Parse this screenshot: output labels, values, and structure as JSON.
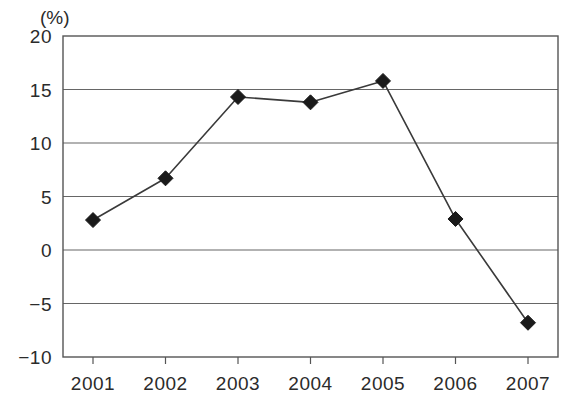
{
  "chart_data": {
    "type": "line",
    "title": "",
    "subtitle": "",
    "xlabel": "",
    "ylabel": "",
    "unit_label": "(%)",
    "categories": [
      "2001",
      "2002",
      "2003",
      "2004",
      "2005",
      "2006",
      "2007"
    ],
    "values": [
      2.8,
      6.7,
      14.3,
      13.8,
      15.8,
      2.9,
      -6.8
    ],
    "series": [
      {
        "name": "",
        "values": [
          2.8,
          6.7,
          14.3,
          13.8,
          15.8,
          2.9,
          -6.8
        ]
      }
    ],
    "ylim": [
      -10,
      20
    ],
    "yticks": [
      20,
      15,
      10,
      5,
      0,
      -5,
      -10
    ],
    "ytick_labels": [
      "20",
      "15",
      "10",
      "5",
      "0",
      "−5",
      "−10"
    ],
    "xtick_labels": [
      "2001",
      "2002",
      "2003",
      "2004",
      "2005",
      "2006",
      "2007"
    ],
    "grid": true,
    "grid_axis": "y",
    "legend": false,
    "legend_position": "none",
    "marker": "diamond",
    "marker_color": "#1a1a1a",
    "line_color": "#3a3a3a",
    "axis_color": "#555555",
    "grid_color": "#666666",
    "background_color": "#ffffff",
    "text_color": "#2b2b2b",
    "annotations": []
  }
}
